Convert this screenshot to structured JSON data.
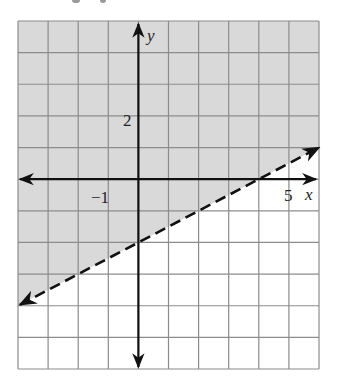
{
  "chart_data": {
    "type": "line",
    "title": "",
    "xlabel": "x",
    "ylabel": "y",
    "xlim": [
      -4,
      6
    ],
    "ylim": [
      -6,
      5
    ],
    "grid": true,
    "grid_step": 1,
    "tick_labels": {
      "x": [
        {
          "value": -1,
          "label": "−1"
        },
        {
          "value": 5,
          "label": "5"
        }
      ],
      "y": [
        {
          "value": 2,
          "label": "2"
        }
      ]
    },
    "series": [
      {
        "name": "boundary",
        "style": "dashed",
        "equation": "y = 0.5x - 2",
        "x": [
          -4,
          0,
          4,
          6
        ],
        "y": [
          -4,
          -2,
          0,
          1
        ],
        "arrows": "both"
      }
    ],
    "shaded_region": {
      "side": "above",
      "inequality": "y > 0.5x - 2",
      "fill": "#d9d9d9"
    },
    "colors": {
      "shade": "#d9d9d9",
      "grid": "#8c8c8c",
      "axis": "#111111",
      "background": "#ffffff"
    }
  },
  "labels": {
    "x_axis": "x",
    "y_axis": "y",
    "tick_neg1": "−1",
    "tick_5": "5",
    "tick_2": "2"
  }
}
